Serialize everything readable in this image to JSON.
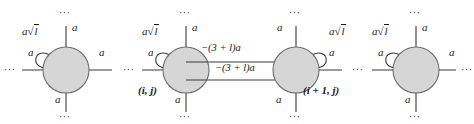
{
  "figure": {
    "type": "graph-diagram",
    "colors": {
      "node_fill": "#d6d6d6",
      "node_stroke": "#6e6e6e",
      "edge_stroke": "#3a3a3a",
      "text": "#1a1a1a",
      "background": "#ffffff"
    },
    "ellipsis": "···"
  },
  "nodes": [
    {
      "id": "node-1",
      "cx": 66,
      "cy": 70,
      "r": 23,
      "label": "",
      "loop_side": "left",
      "loop_label": {
        "coef": "a",
        "radical": "√",
        "radicand": "l"
      },
      "edges": {
        "up": "a",
        "down": "a",
        "left": "a",
        "right": "a"
      }
    },
    {
      "id": "node-2",
      "cx": 186,
      "cy": 70,
      "r": 23,
      "label": "(i, j)",
      "loop_side": "left",
      "loop_label": {
        "coef": "a",
        "radical": "√",
        "radicand": "l"
      },
      "edges": {
        "up": "a",
        "down": "a",
        "left": "a",
        "right": ""
      }
    },
    {
      "id": "node-3",
      "cx": 296,
      "cy": 70,
      "r": 23,
      "label": "(i + 1, j)",
      "loop_side": "right",
      "loop_label": {
        "coef": "a",
        "radical": "√",
        "radicand": "l"
      },
      "edges": {
        "up": "a",
        "down": "a",
        "left": "",
        "right": "a"
      }
    },
    {
      "id": "node-4",
      "cx": 416,
      "cy": 70,
      "r": 23,
      "label": "",
      "loop_side": "left",
      "loop_label": {
        "coef": "a",
        "radical": "√",
        "radicand": "l"
      },
      "edges": {
        "up": "a",
        "down": "a",
        "left": "a",
        "right": "a"
      }
    }
  ],
  "connecting_edges": [
    {
      "id": "edge-upper",
      "from": "node-2",
      "to": "node-3",
      "label": "−(3 + l)a"
    },
    {
      "id": "edge-lower",
      "from": "node-2",
      "to": "node-3",
      "label": "−(3 + l)a"
    }
  ],
  "labels": {
    "a1_up": "a",
    "a1_down": "a",
    "a1_left": "a",
    "a1_right": "a",
    "a2_up": "a",
    "a2_down": "a",
    "a2_left": "a",
    "a3_up": "a",
    "a3_down": "a",
    "a3_right": "a",
    "a4_up": "a",
    "a4_down": "a",
    "a4_left": "a",
    "a4_right": "a",
    "sqrt_coef": "a",
    "sqrt_radical": "√",
    "sqrt_radicand": "l",
    "node2_name": "(i, j)",
    "node3_name": "(i + 1, j)",
    "edge_weight_upper": "−(3 + l)a",
    "edge_weight_lower": "−(3 + l)a",
    "dots": "···"
  }
}
